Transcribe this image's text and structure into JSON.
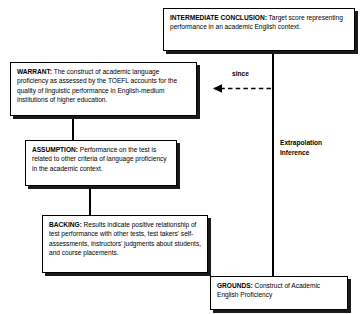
{
  "diagram": {
    "boxes": {
      "conclusion": {
        "lead": "INTERMEDIATE CONCLUSION:",
        "text": " Target score representing performance in an academic English context."
      },
      "warrant": {
        "lead": "WARRANT:",
        "text": " The construct of academic language proficiency as assessed by the TOEFL accounts for the quality of linguistic performance in English-medium institutions of higher education."
      },
      "assumption": {
        "lead": "ASSUMPTION:",
        "text": " Performance on the test is related to other criteria of language proficiency in the academic context."
      },
      "backing": {
        "lead": "BACKING:",
        "text": " Results indicate positive relationship of test performance with other tests, test takers' self-assessments, instructors' judgments about students, and course placements."
      },
      "grounds": {
        "lead": "GROUNDS:",
        "text": " Construct of Academic English Proficiency"
      }
    },
    "labels": {
      "since": "since",
      "inference": "Extrapolation Inference"
    },
    "colors": {
      "line": "#000000",
      "box_fill": "#ffffff",
      "shadow": "#1a1a1a"
    }
  }
}
